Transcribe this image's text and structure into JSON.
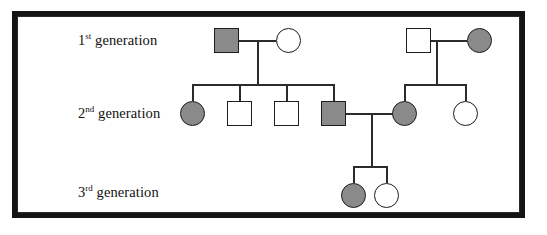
{
  "figure": {
    "background_color": "#ffffff",
    "frame_color": "#141414",
    "line_color": "#2b2b2b",
    "affected_fill_color": "#8a8a8a",
    "unaffected_fill_color": "#ffffff",
    "symbol_outline_color": "#1d1d1d"
  },
  "labels": [
    {
      "id": "generation-1",
      "number": "1",
      "ordinal_suffix": "st",
      "text": "generation",
      "full_text": "1st generation",
      "x": 78,
      "y": 40
    },
    {
      "id": "generation-2",
      "number": "2",
      "ordinal_suffix": "nd",
      "text": "generation",
      "full_text": "2nd generation",
      "x": 78,
      "y": 113
    },
    {
      "id": "generation-3",
      "number": "3",
      "ordinal_suffix": "rd",
      "text": "generation",
      "full_text": "3rd generation",
      "x": 78,
      "y": 192
    }
  ],
  "chart_data": {
    "type": "diagram",
    "diagram_type": "pedigree",
    "generations": 3,
    "legend": {
      "square": "male",
      "circle": "female",
      "shaded": "affected",
      "unshaded": "unaffected"
    },
    "individuals": [
      {
        "id": "I-1",
        "generation": 1,
        "sex": "male",
        "affected": true,
        "shape": "square",
        "x": 214,
        "y": 28,
        "size": 25
      },
      {
        "id": "I-2",
        "generation": 1,
        "sex": "female",
        "affected": false,
        "shape": "circle",
        "x": 276,
        "y": 28,
        "size": 25
      },
      {
        "id": "I-3",
        "generation": 1,
        "sex": "male",
        "affected": false,
        "shape": "square",
        "x": 406,
        "y": 28,
        "size": 25
      },
      {
        "id": "I-4",
        "generation": 1,
        "sex": "female",
        "affected": true,
        "shape": "circle",
        "x": 467,
        "y": 28,
        "size": 25
      },
      {
        "id": "II-1",
        "generation": 2,
        "sex": "female",
        "affected": true,
        "shape": "circle",
        "x": 180,
        "y": 101,
        "size": 25
      },
      {
        "id": "II-2",
        "generation": 2,
        "sex": "male",
        "affected": false,
        "shape": "square",
        "x": 227,
        "y": 101,
        "size": 25
      },
      {
        "id": "II-3",
        "generation": 2,
        "sex": "male",
        "affected": false,
        "shape": "square",
        "x": 274,
        "y": 101,
        "size": 25
      },
      {
        "id": "II-4",
        "generation": 2,
        "sex": "male",
        "affected": true,
        "shape": "square",
        "x": 321,
        "y": 101,
        "size": 25
      },
      {
        "id": "II-5",
        "generation": 2,
        "sex": "female",
        "affected": true,
        "shape": "circle",
        "x": 392,
        "y": 101,
        "size": 25
      },
      {
        "id": "II-6",
        "generation": 2,
        "sex": "female",
        "affected": false,
        "shape": "circle",
        "x": 453,
        "y": 101,
        "size": 25
      },
      {
        "id": "III-1",
        "generation": 3,
        "sex": "female",
        "affected": true,
        "shape": "circle",
        "x": 341,
        "y": 183,
        "size": 25
      },
      {
        "id": "III-2",
        "generation": 3,
        "sex": "female",
        "affected": false,
        "shape": "circle",
        "x": 374,
        "y": 183,
        "size": 25
      }
    ],
    "matings": [
      {
        "id": "mating-1",
        "partners": [
          "I-1",
          "I-2"
        ],
        "children": [
          "II-1",
          "II-2",
          "II-3",
          "II-4"
        ]
      },
      {
        "id": "mating-2",
        "partners": [
          "I-3",
          "I-4"
        ],
        "children": [
          "II-5",
          "II-6"
        ]
      },
      {
        "id": "mating-3",
        "partners": [
          "II-4",
          "II-5"
        ],
        "children": [
          "III-1",
          "III-2"
        ]
      }
    ],
    "counts": {
      "total_individuals": 12,
      "affected_individuals": 6,
      "unaffected_individuals": 6,
      "affected_males": 2,
      "affected_females": 4
    }
  },
  "connectors": [
    {
      "id": "mating-line-1",
      "orient": "h",
      "x": 239,
      "y": 40,
      "length": 37
    },
    {
      "id": "descent-line-1",
      "orient": "v",
      "x": 257,
      "y": 40,
      "length": 44
    },
    {
      "id": "sibship-line-1",
      "orient": "h",
      "x": 192,
      "y": 84,
      "length": 142
    },
    {
      "id": "drop-II-1",
      "orient": "v",
      "x": 192,
      "y": 84,
      "length": 17
    },
    {
      "id": "drop-II-2",
      "orient": "v",
      "x": 239,
      "y": 84,
      "length": 17
    },
    {
      "id": "drop-II-3",
      "orient": "v",
      "x": 286,
      "y": 84,
      "length": 17
    },
    {
      "id": "drop-II-4",
      "orient": "v",
      "x": 333,
      "y": 84,
      "length": 17
    },
    {
      "id": "mating-line-2",
      "orient": "h",
      "x": 431,
      "y": 40,
      "length": 36
    },
    {
      "id": "descent-line-2",
      "orient": "v",
      "x": 436,
      "y": 40,
      "length": 44
    },
    {
      "id": "sibship-line-2",
      "orient": "h",
      "x": 404,
      "y": 84,
      "length": 61
    },
    {
      "id": "drop-II-5",
      "orient": "v",
      "x": 404,
      "y": 84,
      "length": 17
    },
    {
      "id": "drop-II-6",
      "orient": "v",
      "x": 465,
      "y": 84,
      "length": 17
    },
    {
      "id": "mating-line-3",
      "orient": "h",
      "x": 346,
      "y": 113,
      "length": 58
    },
    {
      "id": "descent-line-3",
      "orient": "v",
      "x": 371,
      "y": 113,
      "length": 53
    },
    {
      "id": "sibship-line-3",
      "orient": "h",
      "x": 353,
      "y": 166,
      "length": 33
    },
    {
      "id": "drop-III-1",
      "orient": "v",
      "x": 353,
      "y": 166,
      "length": 17
    },
    {
      "id": "drop-III-2",
      "orient": "v",
      "x": 386,
      "y": 166,
      "length": 17
    }
  ]
}
